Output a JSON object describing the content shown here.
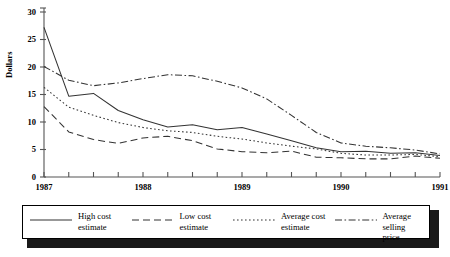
{
  "chart_data": {
    "type": "line",
    "title": "",
    "xlabel": "",
    "ylabel": "Dollars",
    "ylim": [
      0,
      30
    ],
    "yticks": [
      0,
      5,
      10,
      15,
      20,
      25,
      30
    ],
    "xlim": [
      1987.0,
      1991.0
    ],
    "xticks": [
      1987.0,
      1987.25,
      1987.5,
      1987.75,
      1988.0,
      1988.25,
      1988.5,
      1988.75,
      1989.0,
      1989.25,
      1989.5,
      1989.75,
      1990.0,
      1990.25,
      1990.5,
      1990.75,
      1991.0
    ],
    "xtick_labels": [
      "1987",
      "1988",
      "1989",
      "1990",
      "1991"
    ],
    "xtick_label_positions": [
      1987.0,
      1988.0,
      1989.0,
      1990.0,
      1991.0
    ],
    "grid": false,
    "legend_position": "below",
    "x": [
      1987.0,
      1987.25,
      1987.5,
      1987.75,
      1988.0,
      1988.25,
      1988.5,
      1988.75,
      1989.0,
      1989.25,
      1989.5,
      1989.75,
      1990.0,
      1990.25,
      1990.5,
      1990.75,
      1991.0
    ],
    "series": [
      {
        "name": "High cost estimate",
        "style": "solid",
        "values": [
          27.2,
          14.7,
          15.2,
          12.1,
          10.4,
          9.1,
          9.5,
          8.6,
          9.0,
          7.8,
          6.6,
          5.3,
          4.6,
          4.7,
          4.3,
          4.4,
          3.9
        ]
      },
      {
        "name": "Low cost estimate",
        "style": "dashed",
        "values": [
          12.8,
          8.2,
          6.8,
          6.1,
          7.1,
          7.4,
          6.6,
          5.1,
          4.6,
          4.4,
          4.7,
          3.6,
          3.5,
          3.3,
          3.3,
          3.8,
          3.4
        ]
      },
      {
        "name": "Average cost estimate",
        "style": "dotted",
        "values": [
          16.3,
          12.7,
          11.2,
          9.9,
          9.0,
          8.4,
          8.1,
          7.4,
          6.9,
          6.2,
          5.6,
          5.1,
          4.3,
          4.0,
          4.0,
          4.1,
          3.7
        ]
      },
      {
        "name": "Average selling price",
        "style": "dash-dot",
        "values": [
          20.1,
          17.6,
          16.6,
          17.1,
          17.9,
          18.6,
          18.4,
          17.4,
          16.2,
          14.2,
          11.2,
          8.1,
          6.2,
          5.6,
          5.3,
          4.9,
          4.2
        ]
      }
    ]
  },
  "legend": {
    "items": [
      {
        "label_line1": "High cost",
        "label_line2": "estimate",
        "style": "solid"
      },
      {
        "label_line1": "Low cost",
        "label_line2": "estimate",
        "style": "dashed"
      },
      {
        "label_line1": "Average cost",
        "label_line2": "estimate",
        "style": "dotted"
      },
      {
        "label_line1": "Average selling",
        "label_line2": "price",
        "style": "dash-dot"
      }
    ]
  },
  "axis": {
    "y_title": "Dollars",
    "y_labels": [
      "30",
      "25",
      "20",
      "15",
      "10",
      "5",
      "0"
    ],
    "x_labels": [
      "1987",
      "1988",
      "1989",
      "1990",
      "1991"
    ]
  },
  "colors": {
    "line": "#333333",
    "axis": "#555555",
    "text": "#000000",
    "shadow": "#1a1a1a",
    "background": "#ffffff"
  }
}
